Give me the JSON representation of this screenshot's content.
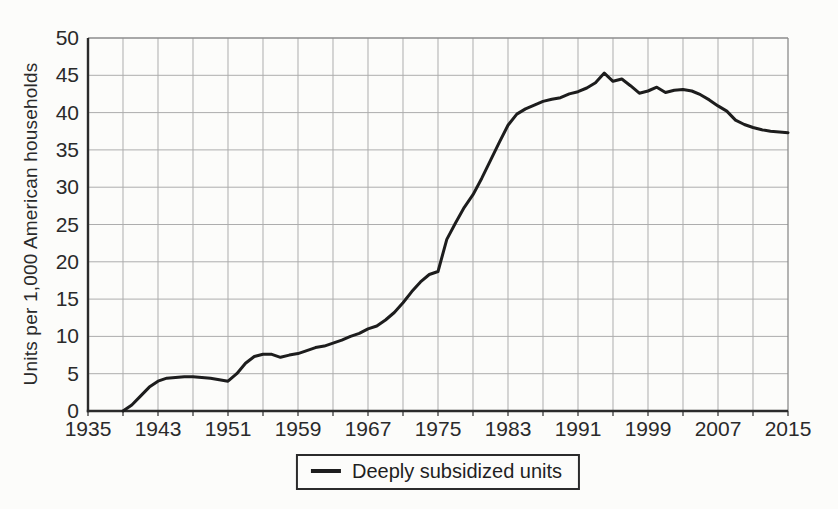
{
  "colors": {
    "background": "#fcfcfa",
    "line": "#1d1d1d",
    "grid": "#adadad",
    "axis": "#2b2b2b",
    "frame": "#8c8c8c",
    "text": "#2a2a2a",
    "legend_border": "#2b2b2b"
  },
  "chart_data": {
    "type": "line",
    "title": "",
    "xlabel": "",
    "ylabel": "Units per 1,000 American households",
    "xlim": [
      1935,
      2015
    ],
    "ylim": [
      0,
      50
    ],
    "xticks": [
      1935,
      1943,
      1951,
      1959,
      1967,
      1975,
      1983,
      1991,
      1999,
      2007,
      2015
    ],
    "yticks": [
      0,
      5,
      10,
      15,
      20,
      25,
      30,
      35,
      40,
      45,
      50
    ],
    "grid": {
      "x_step_years": 4,
      "y_step_units": 5,
      "shown": true
    },
    "legend": {
      "position": "bottom-center",
      "entries": [
        {
          "label": "Deeply subsidized units",
          "color": "#1d1d1d",
          "style": "solid-line"
        }
      ]
    },
    "series": [
      {
        "name": "Deeply subsidized units",
        "x": [
          1939,
          1940,
          1941,
          1942,
          1943,
          1944,
          1945,
          1946,
          1947,
          1948,
          1949,
          1950,
          1951,
          1952,
          1953,
          1954,
          1955,
          1956,
          1957,
          1958,
          1959,
          1960,
          1961,
          1962,
          1963,
          1964,
          1965,
          1966,
          1967,
          1968,
          1969,
          1970,
          1971,
          1972,
          1973,
          1974,
          1975,
          1976,
          1977,
          1978,
          1979,
          1980,
          1981,
          1982,
          1983,
          1984,
          1985,
          1986,
          1987,
          1988,
          1989,
          1990,
          1991,
          1992,
          1993,
          1994,
          1995,
          1996,
          1997,
          1998,
          1999,
          2000,
          2001,
          2002,
          2003,
          2004,
          2005,
          2006,
          2007,
          2008,
          2009,
          2010,
          2011,
          2012,
          2013,
          2014,
          2015
        ],
        "values": [
          0,
          0.8,
          2.0,
          3.2,
          4.0,
          4.4,
          4.5,
          4.6,
          4.6,
          4.5,
          4.4,
          4.2,
          4.0,
          5.0,
          6.4,
          7.3,
          7.6,
          7.6,
          7.2,
          7.5,
          7.7,
          8.1,
          8.5,
          8.7,
          9.1,
          9.5,
          10.0,
          10.4,
          11.0,
          11.4,
          12.2,
          13.2,
          14.5,
          16.0,
          17.3,
          18.3,
          18.7,
          23.0,
          25.2,
          27.3,
          29.0,
          31.2,
          33.6,
          36.0,
          38.3,
          39.8,
          40.5,
          41.0,
          41.5,
          41.8,
          42.0,
          42.5,
          42.8,
          43.3,
          44.0,
          45.3,
          44.2,
          44.5,
          43.6,
          42.6,
          42.9,
          43.4,
          42.7,
          43.0,
          43.1,
          42.9,
          42.4,
          41.7,
          40.9,
          40.2,
          39.0,
          38.4,
          38.0,
          37.7,
          37.5,
          37.4,
          37.3
        ]
      }
    ]
  }
}
